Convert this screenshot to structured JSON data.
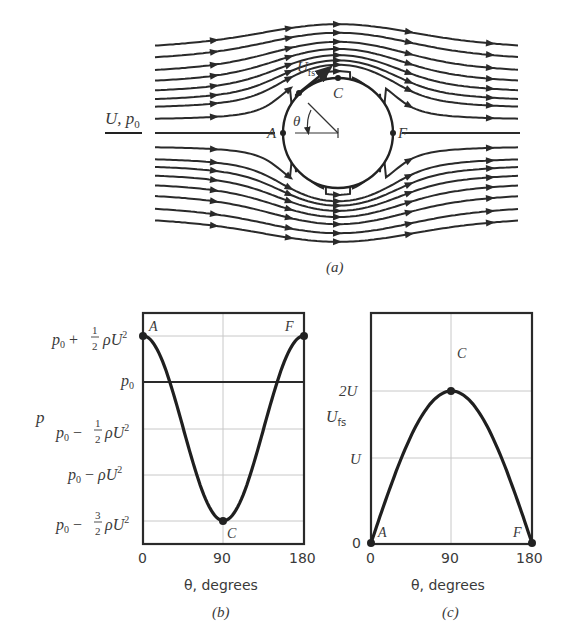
{
  "figure_a": {
    "caption": "(a)",
    "freestream_label": "U, p",
    "freestream_sub": "0",
    "surface_velocity_label": "U",
    "surface_velocity_sub": "fs",
    "angle_label": "θ",
    "points": {
      "A": "A",
      "C": "C",
      "F": "F"
    },
    "cylinder": {
      "cx": 338,
      "cy": 133,
      "r": 55
    }
  },
  "figure_b": {
    "caption": "(b)",
    "ylabel": "p",
    "xlabel": "θ, degrees",
    "xticks": [
      "0",
      "90",
      "180"
    ],
    "yticks": [
      {
        "main": "p",
        "sub": "0",
        "op": " + ",
        "frac": "1/2",
        "tail": "ρU",
        "sup": "2"
      },
      {
        "main": "p",
        "sub": "0",
        "op": "",
        "frac": "",
        "tail": "",
        "sup": ""
      },
      {
        "main": "p",
        "sub": "0",
        "op": " − ",
        "frac": "1/2",
        "tail": "ρU",
        "sup": "2"
      },
      {
        "main": "p",
        "sub": "0",
        "op": " − ",
        "frac": "",
        "tail": "ρU",
        "sup": "2"
      },
      {
        "main": "p",
        "sub": "0",
        "op": " − ",
        "frac": "3/2",
        "tail": "ρU",
        "sup": "2"
      }
    ],
    "point_labels": {
      "A": "A",
      "C": "C",
      "F": "F"
    }
  },
  "figure_c": {
    "caption": "(c)",
    "ylabel": "U",
    "ylabel_sub": "fs",
    "xlabel": "θ, degrees",
    "xticks": [
      "0",
      "90",
      "180"
    ],
    "yticks": [
      "2U",
      "U",
      "0"
    ],
    "point_labels": {
      "A": "A",
      "C": "C",
      "F": "F"
    }
  },
  "chart_data": [
    {
      "type": "line",
      "title": "(b) Surface pressure distribution on a cylinder",
      "xlabel": "θ, degrees",
      "ylabel": "p",
      "xlim": [
        0,
        180
      ],
      "ylim_units": "p0 + k·ρU² (k shown)",
      "ytick_labels": [
        "p0 + 1/2 ρU²",
        "p0",
        "p0 − 1/2 ρU²",
        "p0 − ρU²",
        "p0 − 3/2 ρU²"
      ],
      "ytick_values_k": [
        0.5,
        0,
        -0.5,
        -1.0,
        -1.5
      ],
      "grid": true,
      "series": [
        {
          "name": "p = p0 + 1/2 ρU² (1 − 4 sin²θ)",
          "x": [
            0,
            15,
            30,
            45,
            60,
            75,
            90,
            105,
            120,
            135,
            150,
            165,
            180
          ],
          "k": [
            0.5,
            0.366,
            0.0,
            -0.5,
            -1.0,
            -1.366,
            -1.5,
            -1.366,
            -1.0,
            -0.5,
            0.0,
            0.366,
            0.5
          ]
        }
      ],
      "annotations": [
        {
          "label": "A",
          "x": 0,
          "k": 0.5
        },
        {
          "label": "C",
          "x": 90,
          "k": -1.5
        },
        {
          "label": "F",
          "x": 180,
          "k": 0.5
        }
      ]
    },
    {
      "type": "line",
      "title": "(c) Surface velocity on a cylinder",
      "xlabel": "θ, degrees",
      "ylabel": "U_fs",
      "xlim": [
        0,
        180
      ],
      "ytick_labels": [
        "0",
        "U",
        "2U"
      ],
      "ytick_values": [
        0,
        1,
        2
      ],
      "grid": true,
      "series": [
        {
          "name": "U_fs = 2U sinθ",
          "x": [
            0,
            15,
            30,
            45,
            60,
            75,
            90,
            105,
            120,
            135,
            150,
            165,
            180
          ],
          "values_in_U": [
            0,
            0.518,
            1.0,
            1.414,
            1.732,
            1.932,
            2.0,
            1.932,
            1.732,
            1.414,
            1.0,
            0.518,
            0
          ]
        }
      ],
      "annotations": [
        {
          "label": "A",
          "x": 0,
          "value": 0
        },
        {
          "label": "C",
          "x": 90,
          "value": 2
        },
        {
          "label": "F",
          "x": 180,
          "value": 0
        }
      ]
    }
  ]
}
